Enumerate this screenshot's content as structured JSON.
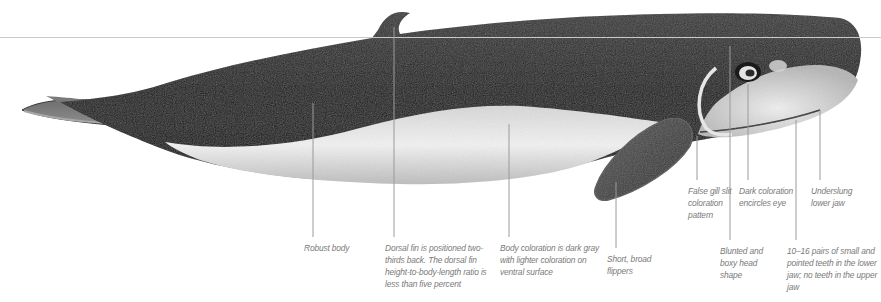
{
  "diagram": {
    "waterline_color": "#c9c9c9",
    "leader_line_color": "#9a9a9a",
    "label_color": "#7a7a7a",
    "annotations": [
      {
        "id": "robust-body",
        "text": "Robust body"
      },
      {
        "id": "dorsal-fin",
        "text": "Dorsal fin is positioned two-thirds back. The dorsal fin height-to-body-length ratio is less than five percent"
      },
      {
        "id": "body-coloration",
        "text": "Body coloration is dark gray with lighter coloration on ventral surface"
      },
      {
        "id": "flippers",
        "text": "Short, broad flippers"
      },
      {
        "id": "false-gill-slit",
        "text": "False gill slit coloration pattern"
      },
      {
        "id": "head-shape",
        "text": "Blunted and boxy head shape"
      },
      {
        "id": "eye-coloration",
        "text": "Dark coloration encircles eye"
      },
      {
        "id": "teeth",
        "text": "10–16 pairs of small and pointed teeth in the lower jaw; no teeth in the upper jaw"
      },
      {
        "id": "lower-jaw",
        "text": "Underslung lower jaw"
      }
    ]
  }
}
